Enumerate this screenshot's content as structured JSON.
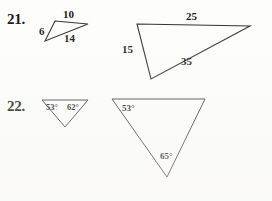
{
  "page": {
    "background_color": "#fdfdfc",
    "ink_color": "#2c2c2c"
  },
  "problems": [
    {
      "number": "21.",
      "type": "side-lengths",
      "figures": [
        {
          "name": "small-triangle",
          "labels": [
            {
              "text": "6",
              "kind": "side"
            },
            {
              "text": "10",
              "kind": "side"
            },
            {
              "text": "14",
              "kind": "side"
            }
          ]
        },
        {
          "name": "large-triangle",
          "labels": [
            {
              "text": "15",
              "kind": "side"
            },
            {
              "text": "25",
              "kind": "side"
            },
            {
              "text": "35",
              "kind": "side"
            }
          ]
        }
      ]
    },
    {
      "number": "22.",
      "type": "angle-measures",
      "figures": [
        {
          "name": "small-triangle",
          "labels": [
            {
              "text": "53°",
              "kind": "angle"
            },
            {
              "text": "62°",
              "kind": "angle"
            }
          ]
        },
        {
          "name": "large-triangle",
          "labels": [
            {
              "text": "53°",
              "kind": "angle"
            },
            {
              "text": "65°",
              "kind": "angle"
            }
          ]
        }
      ]
    }
  ],
  "figure_geometry": {
    "p21_small": "55,21 88,24 45,41",
    "p21_large": "137,24 250,26 151,79",
    "p22_small": "42,100 88,100 65,127",
    "p22_large": "112,99 205,99 167,177"
  },
  "labels": {
    "p21_small_6": "6",
    "p21_small_10": "10",
    "p21_small_14": "14",
    "p21_large_15": "15",
    "p21_large_25": "25",
    "p21_large_35": "35",
    "p22_small_53": "53°",
    "p22_small_62": "62°",
    "p22_large_53": "53°",
    "p22_large_65": "65°",
    "num_21": "21.",
    "num_22": "22."
  }
}
